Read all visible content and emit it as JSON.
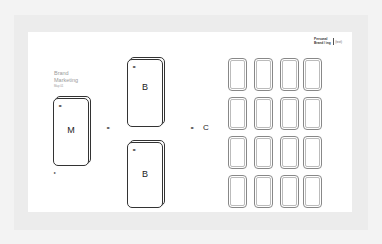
{
  "header": {
    "tag_line1": "Personal",
    "tag_line2": "Brand / ing",
    "tag_sub": "(text)"
  },
  "left_panel": {
    "title_line1": "Brand",
    "title_line2": "Marketing",
    "subtitle": "Map 01"
  },
  "nodes": {
    "m": {
      "letter": "M",
      "mark": "▸▸"
    },
    "b1": {
      "letter": "B",
      "mark": "▸▸"
    },
    "b2": {
      "letter": "B",
      "mark": "▸▸"
    },
    "c": {
      "letter": "C"
    }
  },
  "arrows": {
    "m_to_b": "▸▸",
    "b_to_c": "▸▸",
    "footnote": "▸"
  },
  "grid": {
    "rows": 4,
    "cols": 4
  }
}
